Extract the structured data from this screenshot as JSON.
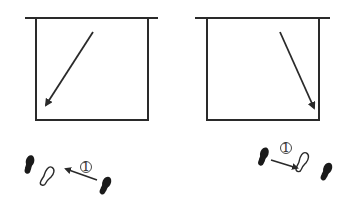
{
  "diagram": {
    "stroke_color": "#2a2a2a",
    "background": "#ffffff",
    "panels": [
      {
        "id": "left",
        "court_box": {
          "x": 36,
          "y": 18,
          "w": 112,
          "h": 102
        },
        "top_line": {
          "x1": 25,
          "x2": 158,
          "y": 18
        },
        "arrow": {
          "from": [
            93,
            32
          ],
          "to": [
            45,
            107
          ],
          "direction": "down-left"
        }
      },
      {
        "id": "right",
        "court_box": {
          "x": 207,
          "y": 18,
          "w": 112,
          "h": 102
        },
        "top_line": {
          "x1": 195,
          "x2": 330,
          "y": 18
        },
        "arrow": {
          "from": [
            280,
            32
          ],
          "to": [
            315,
            110
          ],
          "direction": "down-right"
        }
      }
    ],
    "footwork": [
      {
        "id": "left",
        "step_label": "①",
        "feet": [
          {
            "type": "solid",
            "role": "left-foot-start"
          },
          {
            "type": "outline",
            "role": "step-target"
          },
          {
            "type": "solid",
            "role": "right-foot-start"
          }
        ],
        "arrow_direction": "up-left"
      },
      {
        "id": "right",
        "step_label": "①",
        "feet": [
          {
            "type": "solid",
            "role": "left-foot-start"
          },
          {
            "type": "outline",
            "role": "step-target"
          },
          {
            "type": "solid",
            "role": "right-foot-start"
          }
        ],
        "arrow_direction": "down-right"
      }
    ]
  }
}
